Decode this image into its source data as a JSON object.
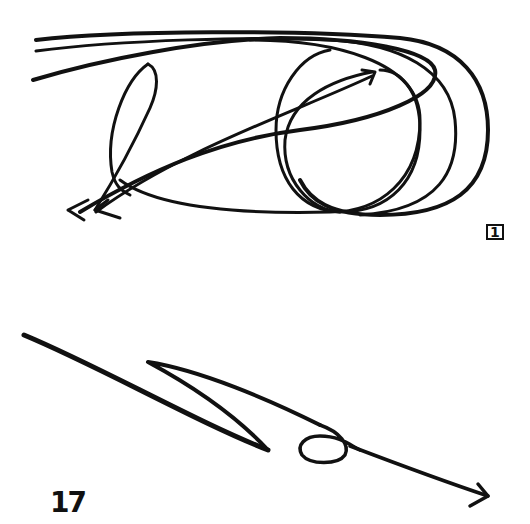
{
  "figure": {
    "type": "hand-drawn motion sketch",
    "background": "#ffffff",
    "ink_color": "#111111",
    "panels": [
      {
        "id": "upper",
        "label": "1",
        "description": "looping strokes with ellipses and arrows pointing lower-left"
      },
      {
        "id": "lower",
        "label": "17",
        "description": "zig-zag stroke with small loop ending in arrow pointing lower-right"
      }
    ]
  },
  "labels": {
    "upper_panel": "1",
    "lower_panel": "17"
  }
}
